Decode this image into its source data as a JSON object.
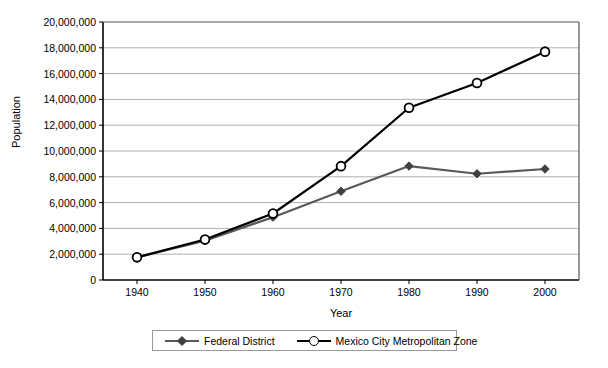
{
  "chart_data": {
    "type": "line",
    "title": "",
    "xlabel": "Year",
    "ylabel": "Population",
    "x": [
      1940,
      1950,
      1960,
      1970,
      1980,
      1990,
      2000
    ],
    "categories": [
      "1940",
      "1950",
      "1960",
      "1970",
      "1980",
      "1990",
      "2000"
    ],
    "xlim": [
      1935,
      2005
    ],
    "ylim": [
      0,
      20000000
    ],
    "ytick_values": [
      0,
      2000000,
      4000000,
      6000000,
      8000000,
      10000000,
      12000000,
      14000000,
      16000000,
      18000000,
      20000000
    ],
    "ytick_labels": [
      "0",
      "2,000,000",
      "4,000,000",
      "6,000,000",
      "8,000,000",
      "10,000,000",
      "12,000,000",
      "14,000,000",
      "16,000,000",
      "18,000,000",
      "20,000,000"
    ],
    "grid": "horizontal",
    "legend_position": "bottom",
    "series": [
      {
        "name": "Federal District",
        "color": "#595959",
        "marker": "diamond",
        "marker_color": "#404040",
        "values": [
          1757530,
          3050442,
          4870876,
          6874165,
          8831079,
          8235744,
          8605239
        ]
      },
      {
        "name": "Mexico City Metropolitan Zone",
        "color": "#000000",
        "marker": "circle-open",
        "marker_color": "#000000",
        "values": [
          1757530,
          3137599,
          5155327,
          8823916,
          13354271,
          15277000,
          17700000
        ]
      }
    ]
  },
  "axes": {
    "y_title": "Population",
    "x_title": "Year"
  },
  "legend": {
    "items": [
      {
        "label": "Federal District"
      },
      {
        "label": "Mexico City Metropolitan Zone"
      }
    ]
  }
}
